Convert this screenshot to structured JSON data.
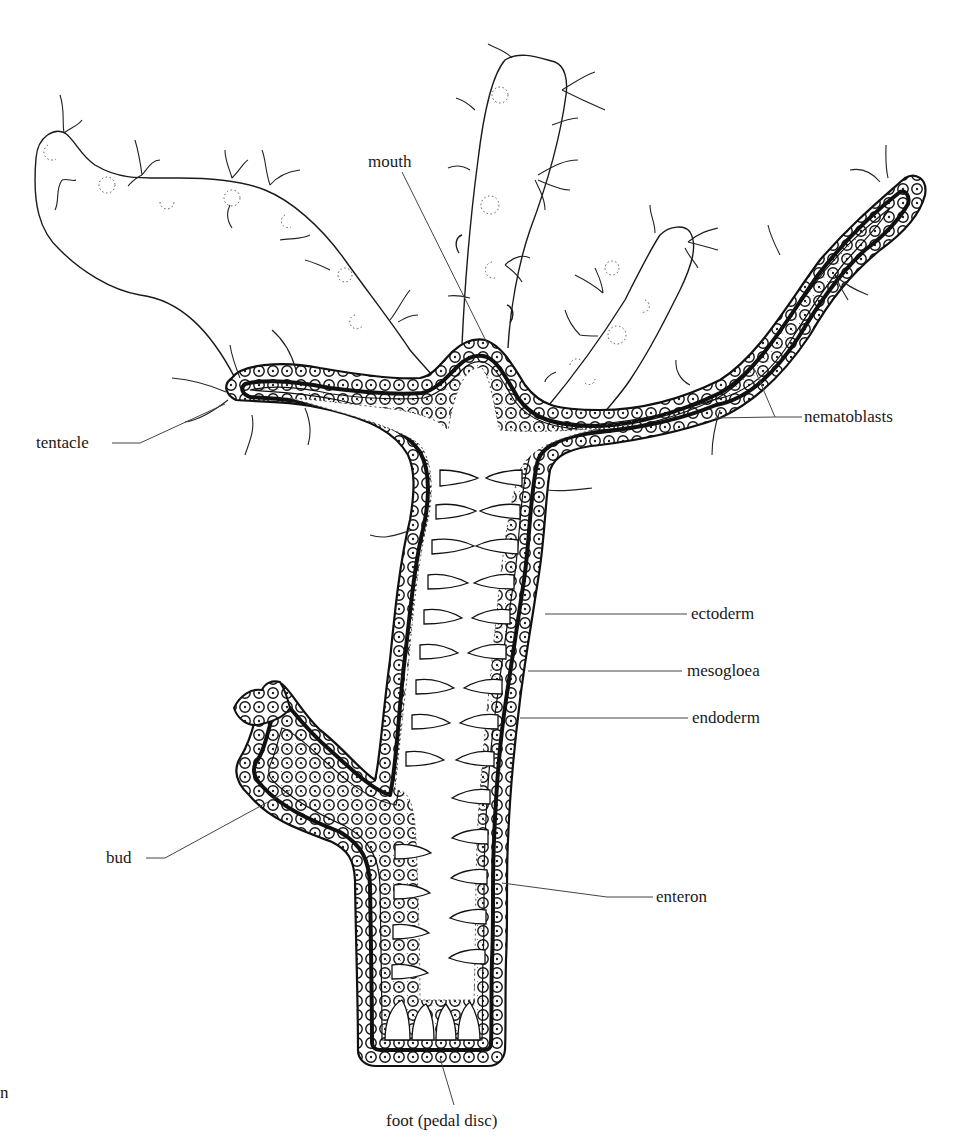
{
  "figure": {
    "labels": {
      "mouth": "mouth",
      "tentacle": "tentacle",
      "nematoblasts": "nematoblasts",
      "ectoderm": "ectoderm",
      "mesogloea": "mesogloea",
      "endoderm": "endoderm",
      "bud": "bud",
      "enteron": "enteron",
      "foot": "foot (pedal disc)",
      "edge_fragment": "n"
    },
    "colors": {
      "ink": "#1a1a1a",
      "background": "#ffffff",
      "leader": "#444444"
    }
  }
}
